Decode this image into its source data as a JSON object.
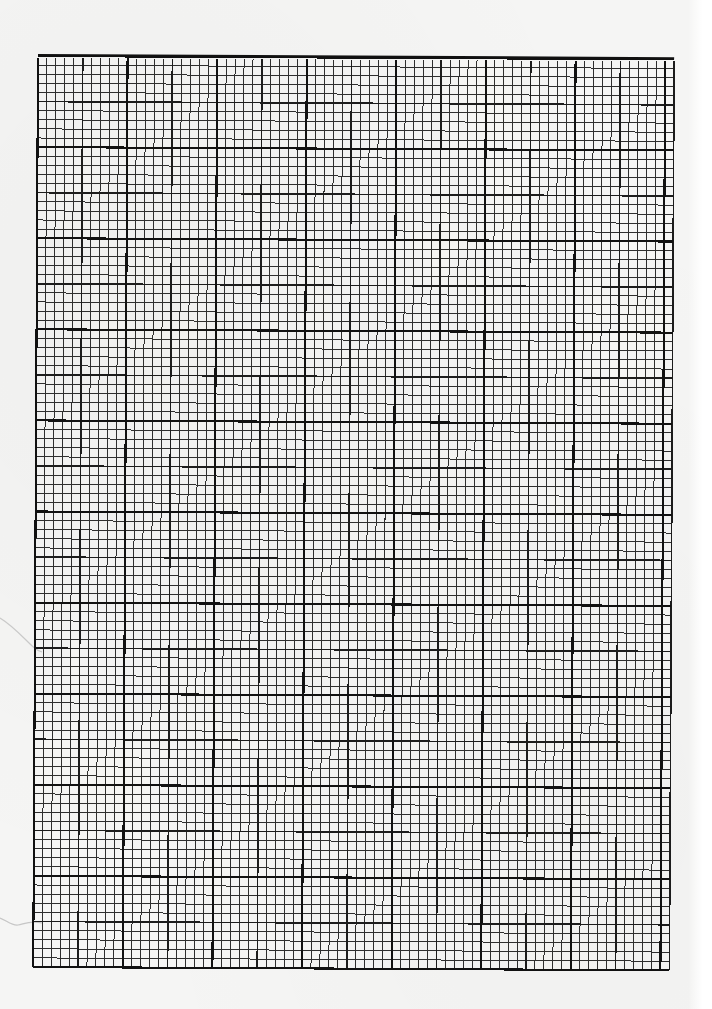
{
  "document": {
    "type": "graph-paper-scan",
    "description": "Blank sheet of millimetre-style graph paper, no handwriting or printed text"
  },
  "grid": {
    "left": 38,
    "top": 56,
    "columns": 71,
    "rows": 100,
    "cell_width": 8.96,
    "cell_height": 9.11,
    "medium_every": 5,
    "heavy_every": 10,
    "colors": {
      "paper": "#f5f5f4",
      "minor_line": "#2e2e2e",
      "medium_line": "#1c1c1c",
      "heavy_line": "#111111"
    },
    "stroke": {
      "minor": 1.0,
      "medium": 1.6,
      "heavy": 2.1,
      "top_border": 2.2
    }
  },
  "annotations": []
}
